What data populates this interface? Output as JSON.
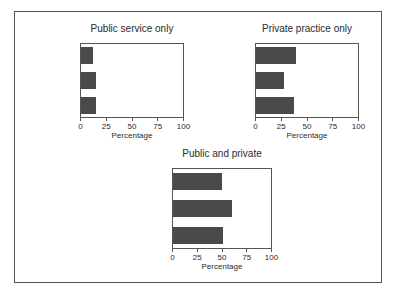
{
  "chart_data": [
    {
      "type": "bar",
      "orientation": "horizontal",
      "title": "Public service only",
      "categories": [
        "Merit",
        "Appointment",
        "Election"
      ],
      "values": [
        12,
        14,
        14
      ],
      "xlabel": "Percentage",
      "ylabel": "",
      "xlim": [
        0,
        100
      ],
      "xticks": [
        "0",
        "25",
        "50",
        "75",
        "100"
      ],
      "grid": false,
      "legend": null
    },
    {
      "type": "bar",
      "orientation": "horizontal",
      "title": "Private practice only",
      "categories": [
        "Merit",
        "Appointment",
        "Election"
      ],
      "values": [
        38,
        27,
        37
      ],
      "xlabel": "Percentage",
      "ylabel": "",
      "xlim": [
        0,
        100
      ],
      "xticks": [
        "0",
        "25",
        "50",
        "75",
        "100"
      ],
      "grid": false,
      "legend": null
    },
    {
      "type": "bar",
      "orientation": "horizontal",
      "title": "Public and private",
      "categories": [
        "Merit",
        "Appointment",
        "Election"
      ],
      "values": [
        49,
        59,
        50
      ],
      "xlabel": "Percentage",
      "ylabel": "",
      "xlim": [
        0,
        100
      ],
      "xticks": [
        "0",
        "25",
        "50",
        "75",
        "100"
      ],
      "grid": false,
      "legend": null
    }
  ],
  "colors": {
    "bar": "#4a4a4a",
    "axis": "#555555"
  }
}
